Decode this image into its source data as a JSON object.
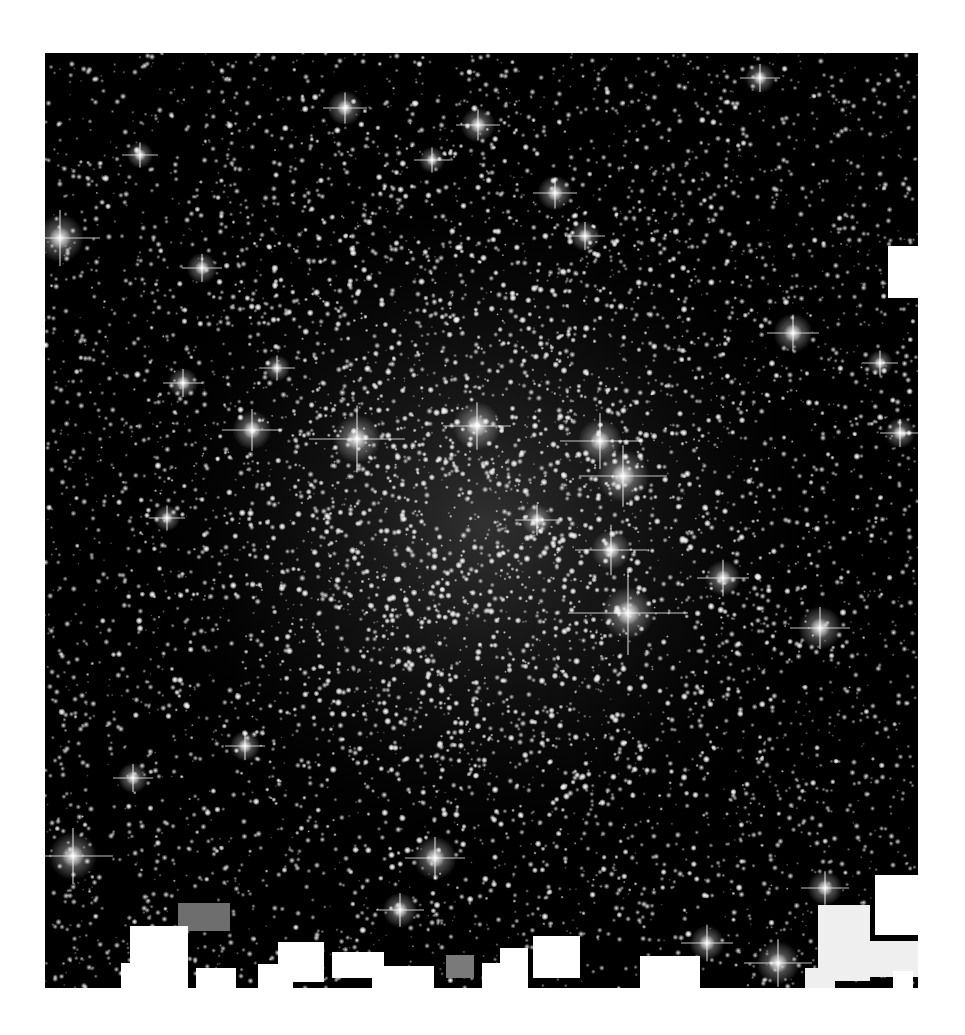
{
  "image": {
    "subject": "globular star cluster",
    "background": "#000000",
    "page_background": "#ffffff",
    "frame": {
      "x": 45,
      "y": 53,
      "width": 873,
      "height": 935
    },
    "cluster_center": {
      "x": 440,
      "y": 470
    },
    "star_density": {
      "field_count": 5200,
      "core_count": 4200,
      "core_sigma": 210
    }
  },
  "bright_stars": [
    {
      "x": 312,
      "y": 386,
      "r": 11,
      "spike": 48
    },
    {
      "x": 432,
      "y": 373,
      "r": 11,
      "spike": 34
    },
    {
      "x": 555,
      "y": 388,
      "r": 10,
      "spike": 40
    },
    {
      "x": 578,
      "y": 423,
      "r": 12,
      "spike": 44
    },
    {
      "x": 583,
      "y": 560,
      "r": 12,
      "spike": 60
    },
    {
      "x": 566,
      "y": 497,
      "r": 9,
      "spike": 36
    },
    {
      "x": 207,
      "y": 377,
      "r": 9,
      "spike": 30
    },
    {
      "x": 492,
      "y": 467,
      "r": 7,
      "spike": 22
    },
    {
      "x": 678,
      "y": 525,
      "r": 8,
      "spike": 26
    },
    {
      "x": 775,
      "y": 575,
      "r": 10,
      "spike": 30
    },
    {
      "x": 15,
      "y": 185,
      "r": 11,
      "spike": 40
    },
    {
      "x": 300,
      "y": 55,
      "r": 8,
      "spike": 22
    },
    {
      "x": 433,
      "y": 72,
      "r": 8,
      "spike": 22
    },
    {
      "x": 510,
      "y": 140,
      "r": 8,
      "spike": 22
    },
    {
      "x": 540,
      "y": 183,
      "r": 7,
      "spike": 20
    },
    {
      "x": 715,
      "y": 25,
      "r": 7,
      "spike": 20
    },
    {
      "x": 748,
      "y": 280,
      "r": 9,
      "spike": 26
    },
    {
      "x": 28,
      "y": 803,
      "r": 11,
      "spike": 40
    },
    {
      "x": 390,
      "y": 805,
      "r": 10,
      "spike": 30
    },
    {
      "x": 355,
      "y": 857,
      "r": 8,
      "spike": 24
    },
    {
      "x": 662,
      "y": 890,
      "r": 8,
      "spike": 26
    },
    {
      "x": 733,
      "y": 910,
      "r": 10,
      "spike": 34
    },
    {
      "x": 780,
      "y": 835,
      "r": 8,
      "spike": 24
    },
    {
      "x": 88,
      "y": 725,
      "r": 7,
      "spike": 20
    },
    {
      "x": 200,
      "y": 693,
      "r": 7,
      "spike": 20
    },
    {
      "x": 157,
      "y": 215,
      "r": 7,
      "spike": 20
    },
    {
      "x": 387,
      "y": 107,
      "r": 6,
      "spike": 18
    },
    {
      "x": 95,
      "y": 102,
      "r": 6,
      "spike": 18
    },
    {
      "x": 138,
      "y": 330,
      "r": 7,
      "spike": 20
    },
    {
      "x": 232,
      "y": 315,
      "r": 6,
      "spike": 18
    },
    {
      "x": 855,
      "y": 380,
      "r": 7,
      "spike": 20
    },
    {
      "x": 835,
      "y": 310,
      "r": 6,
      "spike": 18
    },
    {
      "x": 122,
      "y": 465,
      "r": 6,
      "spike": 18
    }
  ],
  "masks": [
    {
      "x": 133,
      "y": 850,
      "w": 52,
      "h": 28,
      "color": "#6e6e6e"
    },
    {
      "x": 401,
      "y": 902,
      "w": 28,
      "h": 23,
      "color": "#7a7a7a"
    },
    {
      "x": 85,
      "y": 873,
      "w": 58,
      "h": 62,
      "color": "#ffffff"
    },
    {
      "x": 76,
      "y": 910,
      "w": 45,
      "h": 25,
      "color": "#ffffff"
    },
    {
      "x": 151,
      "y": 915,
      "w": 40,
      "h": 20,
      "color": "#ffffff"
    },
    {
      "x": 213,
      "y": 911,
      "w": 35,
      "h": 24,
      "color": "#ffffff"
    },
    {
      "x": 233,
      "y": 889,
      "w": 46,
      "h": 40,
      "color": "#ffffff"
    },
    {
      "x": 287,
      "y": 899,
      "w": 52,
      "h": 26,
      "color": "#ffffff"
    },
    {
      "x": 327,
      "y": 913,
      "w": 62,
      "h": 22,
      "color": "#ffffff"
    },
    {
      "x": 437,
      "y": 910,
      "w": 40,
      "h": 25,
      "color": "#ffffff"
    },
    {
      "x": 455,
      "y": 895,
      "w": 28,
      "h": 40,
      "color": "#ffffff"
    },
    {
      "x": 488,
      "y": 883,
      "w": 47,
      "h": 42,
      "color": "#ffffff"
    },
    {
      "x": 595,
      "y": 903,
      "w": 60,
      "h": 32,
      "color": "#ffffff"
    },
    {
      "x": 773,
      "y": 852,
      "w": 52,
      "h": 76,
      "color": "#efefef"
    },
    {
      "x": 760,
      "y": 915,
      "w": 30,
      "h": 20,
      "color": "#efefef"
    },
    {
      "x": 782,
      "y": 888,
      "w": 91,
      "h": 36,
      "color": "#efefef"
    },
    {
      "x": 830,
      "y": 822,
      "w": 43,
      "h": 60,
      "color": "#ffffff"
    },
    {
      "x": 848,
      "y": 918,
      "w": 20,
      "h": 17,
      "color": "#ffffff"
    },
    {
      "x": 843,
      "y": 193,
      "w": 30,
      "h": 52,
      "color": "#ffffff"
    }
  ]
}
